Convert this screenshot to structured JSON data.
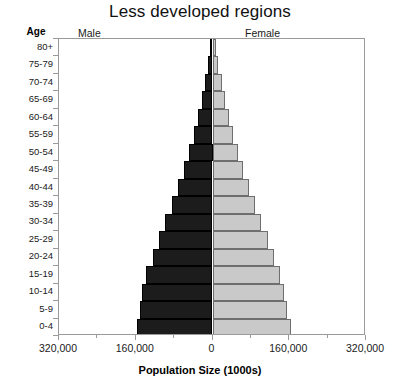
{
  "chart": {
    "title": "Less developed regions",
    "age_axis_header": "Age",
    "male_caption": "Male",
    "female_caption": "Female",
    "xlabel": "Population Size (1000s)"
  },
  "chart_data": {
    "type": "bar",
    "subtype": "population-pyramid",
    "title": "Less developed regions",
    "xlabel": "Population Size (1000s)",
    "ylabel": "Age",
    "xlim": [
      -320000,
      320000
    ],
    "xticks": [
      -320000,
      -160000,
      0,
      160000,
      320000
    ],
    "xtick_labels": [
      "320,000",
      "160,000",
      "0",
      "160,000",
      "320,000"
    ],
    "grid": false,
    "legend": "none",
    "categories": [
      "80+",
      "75-79",
      "70-74",
      "65-69",
      "60-64",
      "55-59",
      "50-54",
      "45-49",
      "40-44",
      "35-39",
      "30-34",
      "25-29",
      "20-24",
      "15-19",
      "10-14",
      "5-9",
      "0-4"
    ],
    "series": [
      {
        "name": "Male",
        "color": "#1c1c1c",
        "values": [
          6000,
          9000,
          15000,
          22000,
          30000,
          39000,
          49000,
          60000,
          72000,
          85000,
          98000,
          112000,
          125000,
          138000,
          148000,
          152000,
          158000
        ]
      },
      {
        "name": "Female",
        "color": "#c9c9c9",
        "values": [
          8000,
          12000,
          19000,
          26000,
          34000,
          43000,
          53000,
          64000,
          76000,
          89000,
          102000,
          115000,
          128000,
          140000,
          150000,
          155000,
          163000
        ]
      }
    ]
  }
}
